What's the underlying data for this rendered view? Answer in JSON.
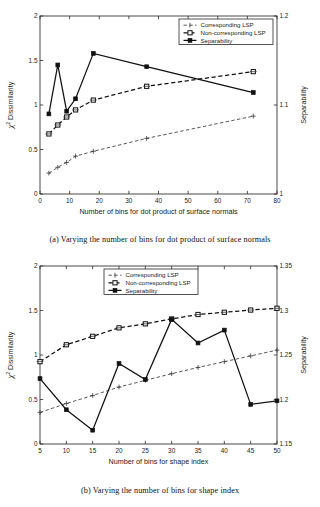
{
  "figures": [
    {
      "id": "a",
      "caption": "(a) Varying the number of bins for dot product of surface normals",
      "chart_data": {
        "type": "line",
        "title": "",
        "xlabel": "Number of bins for dot product of surface normals",
        "ylabel": "χ² Dissimilarity",
        "ylabel_secondary": "Separability",
        "xlim": [
          0,
          80
        ],
        "ylim": [
          0,
          2
        ],
        "ylim_secondary": [
          1,
          1.2
        ],
        "xticks": [
          0,
          10,
          20,
          30,
          40,
          50,
          60,
          70,
          80
        ],
        "yticks": [
          0,
          0.5,
          1,
          1.5,
          2
        ],
        "yticks_secondary": [
          1,
          1.1,
          1.2
        ],
        "grid": false,
        "legend_position": "top-right",
        "series": [
          {
            "name": "Corresponding LSP",
            "axis": "left",
            "style": "dashed-light",
            "marker": "plus",
            "x": [
              3,
              6,
              9,
              12,
              18,
              36,
              72
            ],
            "values": [
              0.235,
              0.3,
              0.355,
              0.425,
              0.48,
              0.625,
              0.875
            ]
          },
          {
            "name": "Non-corresponding LSP",
            "axis": "left",
            "style": "dashed-heavy",
            "marker": "square-open",
            "x": [
              3,
              6,
              9,
              12,
              18,
              36,
              72
            ],
            "values": [
              0.675,
              0.775,
              0.865,
              0.945,
              1.055,
              1.21,
              1.375
            ]
          },
          {
            "name": "Separability",
            "axis": "right",
            "style": "solid",
            "marker": "square-filled",
            "x": [
              3,
              6,
              9,
              12,
              18,
              36,
              72
            ],
            "values": [
              1.09,
              1.145,
              1.093,
              1.107,
              1.158,
              1.143,
              1.114
            ]
          }
        ]
      }
    },
    {
      "id": "b",
      "caption": "(b) Varying the number of bins for shape index",
      "chart_data": {
        "type": "line",
        "title": "",
        "xlabel": "Number of bins for shape index",
        "ylabel": "χ² Dissimilarity",
        "ylabel_secondary": "Separability",
        "xlim": [
          5,
          50
        ],
        "ylim": [
          0,
          2
        ],
        "ylim_secondary": [
          1.15,
          1.35
        ],
        "xticks": [
          5,
          10,
          15,
          20,
          25,
          30,
          35,
          40,
          45,
          50
        ],
        "yticks": [
          0,
          0.5,
          1,
          1.5,
          2
        ],
        "yticks_secondary": [
          1.15,
          1.2,
          1.25,
          1.3,
          1.35
        ],
        "grid": false,
        "legend_position": "top-center",
        "series": [
          {
            "name": "Corresponding LSP",
            "axis": "left",
            "style": "dashed-light",
            "marker": "plus",
            "x": [
              5,
              10,
              15,
              20,
              25,
              30,
              35,
              40,
              45,
              50
            ],
            "values": [
              0.355,
              0.455,
              0.545,
              0.64,
              0.715,
              0.79,
              0.86,
              0.925,
              0.99,
              1.055
            ]
          },
          {
            "name": "Non-corresponding LSP",
            "axis": "left",
            "style": "dashed-heavy",
            "marker": "square-open",
            "x": [
              5,
              10,
              15,
              20,
              25,
              30,
              35,
              40,
              45,
              50
            ],
            "values": [
              0.925,
              1.115,
              1.21,
              1.305,
              1.35,
              1.405,
              1.455,
              1.48,
              1.505,
              1.525
            ]
          },
          {
            "name": "Separability",
            "axis": "right",
            "style": "solid",
            "marker": "square-filled",
            "x": [
              5,
              10,
              15,
              20,
              25,
              30,
              35,
              40,
              45,
              50
            ],
            "values": [
              1.2235,
              1.1885,
              1.1655,
              1.2405,
              1.2225,
              1.29,
              1.2635,
              1.278,
              1.1945,
              1.1985
            ]
          }
        ]
      }
    }
  ],
  "legend": {
    "items": [
      {
        "label": "Corresponding LSP",
        "marker": "plus",
        "style": "dashed-light"
      },
      {
        "label": "Non-corresponding LSP",
        "marker": "square-open",
        "style": "dashed-heavy"
      },
      {
        "label": "Separability",
        "marker": "square-filled",
        "style": "solid"
      }
    ]
  },
  "axis_text": {
    "chi_symbol": "χ",
    "chi_exponent": "2",
    "dissimilarity": "Dissimilarity",
    "separability": "Separability"
  }
}
